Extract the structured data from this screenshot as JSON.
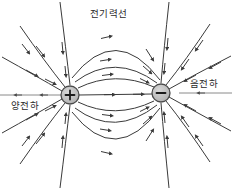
{
  "diagram": {
    "title_label": "전기력선",
    "positive_charge_label": "양전하",
    "negative_charge_label": "음전하",
    "positive_sign": "+",
    "negative_sign": "−",
    "colors": {
      "line": "#3a3a3a",
      "axis": "#8a8a8a",
      "charge_fill": "#b9b9b9",
      "charge_stroke": "#4a4a4a",
      "text": "#2b2b2b",
      "background": "#ffffff"
    },
    "geometry": {
      "width": 232,
      "height": 189,
      "positive_charge_x": 70,
      "positive_charge_y": 95,
      "negative_charge_x": 161,
      "negative_charge_y": 93,
      "charge_radius": 9
    }
  }
}
